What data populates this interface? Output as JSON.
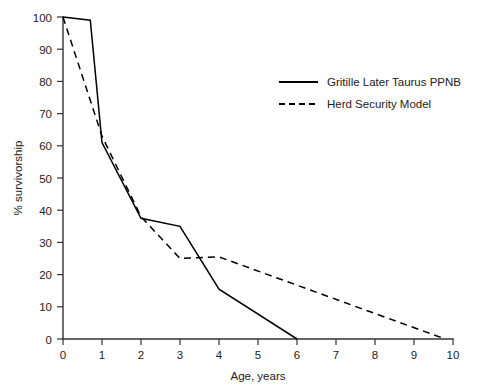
{
  "chart_data": {
    "type": "line",
    "title": "",
    "xlabel": "Age, years",
    "ylabel": "% survivorship",
    "xlim": [
      0,
      10
    ],
    "ylim": [
      0,
      100
    ],
    "xticks": [
      "0",
      "1",
      "2",
      "3",
      "4",
      "5",
      "6",
      "7",
      "8",
      "9",
      "10"
    ],
    "yticks": [
      "0",
      "10",
      "20",
      "30",
      "40",
      "50",
      "60",
      "70",
      "80",
      "90",
      "100"
    ],
    "grid": false,
    "legend_position": "upper right",
    "series": [
      {
        "name": "Gritille Later Taurus PPNB",
        "style": "solid",
        "color": "#000000",
        "points": [
          {
            "x": 0,
            "y": 100
          },
          {
            "x": 0.7,
            "y": 99
          },
          {
            "x": 1,
            "y": 61
          },
          {
            "x": 2,
            "y": 37.5
          },
          {
            "x": 3,
            "y": 35
          },
          {
            "x": 4,
            "y": 15.5
          },
          {
            "x": 6,
            "y": 0
          }
        ]
      },
      {
        "name": "Herd Security Model",
        "style": "dashed",
        "color": "#000000",
        "points": [
          {
            "x": 0,
            "y": 100
          },
          {
            "x": 1,
            "y": 63
          },
          {
            "x": 2,
            "y": 38
          },
          {
            "x": 3,
            "y": 25
          },
          {
            "x": 4,
            "y": 25.5
          },
          {
            "x": 9.8,
            "y": 0
          }
        ]
      }
    ]
  },
  "legend": {
    "entries": [
      {
        "label": "Gritille Later Taurus PPNB",
        "style": "solid"
      },
      {
        "label": "Herd Security Model",
        "style": "dashed"
      }
    ]
  }
}
